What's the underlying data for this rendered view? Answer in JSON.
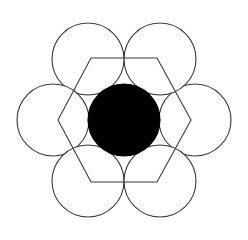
{
  "figure": {
    "canvas": {
      "width": 248,
      "height": 240,
      "background": "#ffffff"
    },
    "colors": {
      "stroke": "#3a3a3a",
      "fill_outer": "#ffffff",
      "fill_center": "#000000",
      "background": "#ffffff"
    },
    "stroke_width": 1.1
  },
  "chart_data": {
    "type": "scatter",
    "xlabel": "",
    "ylabel": "",
    "xlim": [
      0,
      248
    ],
    "ylim": [
      0,
      240
    ],
    "grid": false,
    "legend": "none",
    "geometry_notes": "Six unit circles of radius 36 arranged at 60 degree intervals on a circle of radius 71 about the centre; a seventh identical circle, filled solid black, sits at the centre. A regular hexagon of circumradius 67 with pointed left and right vertices and flat top and bottom edges is overlaid.",
    "center": {
      "x": 124,
      "y": 120
    },
    "circle_radius": 36,
    "ring_radius": 71,
    "circles": [
      {
        "name": "center-circle",
        "cx": 124,
        "cy": 120,
        "r": 36,
        "fill": "#000000",
        "angle_deg": null,
        "filled": true
      },
      {
        "name": "circle-right",
        "cx": 195,
        "cy": 120,
        "r": 36,
        "fill": "#ffffff",
        "angle_deg": 0,
        "filled": false
      },
      {
        "name": "circle-top-right",
        "cx": 160,
        "cy": 59,
        "r": 36,
        "fill": "#ffffff",
        "angle_deg": 60,
        "filled": false
      },
      {
        "name": "circle-top-left",
        "cx": 88,
        "cy": 59,
        "r": 36,
        "fill": "#ffffff",
        "angle_deg": 120,
        "filled": false
      },
      {
        "name": "circle-left",
        "cx": 53,
        "cy": 120,
        "r": 36,
        "fill": "#ffffff",
        "angle_deg": 180,
        "filled": false
      },
      {
        "name": "circle-bottom-left",
        "cx": 88,
        "cy": 181,
        "r": 36,
        "fill": "#ffffff",
        "angle_deg": 240,
        "filled": false
      },
      {
        "name": "circle-bottom-right",
        "cx": 160,
        "cy": 181,
        "r": 36,
        "fill": "#ffffff",
        "angle_deg": 300,
        "filled": false
      }
    ],
    "hexagon": {
      "name": "overlay-hexagon",
      "circumradius": 67,
      "orientation": "pointy-left-right",
      "points": "58,120 91,58 157,58 191,120 157,182 91,182",
      "vertices": [
        {
          "label": "left",
          "x": 58,
          "y": 120
        },
        {
          "label": "top-left",
          "x": 91,
          "y": 58
        },
        {
          "label": "top-right",
          "x": 157,
          "y": 58
        },
        {
          "label": "right",
          "x": 191,
          "y": 120
        },
        {
          "label": "bottom-right",
          "x": 157,
          "y": 182
        },
        {
          "label": "bottom-left",
          "x": 91,
          "y": 182
        }
      ]
    }
  },
  "watermarks": {
    "top_left_fragment": "",
    "top_right_fragment": "",
    "center_line_1": "",
    "center_line_2": ""
  }
}
